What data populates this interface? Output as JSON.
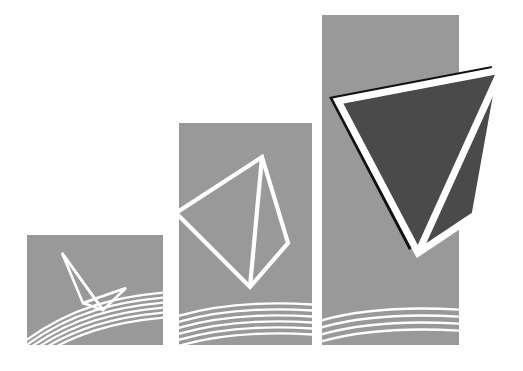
{
  "artwork": {
    "title": "Abstract bar-chart logo with tetrahedra",
    "canvas": {
      "width": 523,
      "height": 371,
      "background": "#ffffff"
    },
    "palette": {
      "bar_gray": "#999999",
      "solid_dark": "#4a4a4a",
      "shadow_black": "#111111",
      "outline_white": "#ffffff",
      "background": "#ffffff"
    },
    "bars": [
      {
        "name": "bar-small",
        "index": 1,
        "x": 27,
        "y": 235,
        "width": 136,
        "height": 110,
        "fill": "#999999",
        "wire_label": "small-tetrahedron",
        "wire_points": "62,253 83,303 126,288 103,310 62,253",
        "wire_edges": [
          "62,253 83,303",
          "83,303 126,288",
          "126,288 103,310",
          "103,310 62,253",
          "83,303 103,310"
        ],
        "arcs": [
          "27,338 C 70,305 120,296 163,292",
          "27,341 C 70,309 120,300 163,296",
          "27,344 C 70,313 120,304 163,300",
          "27,347 C 70,317 120,308 163,304",
          "27,350 C 70,321 120,312 163,308",
          "27,353 C 70,325 120,316 163,312"
        ]
      },
      {
        "name": "bar-medium",
        "index": 2,
        "x": 179,
        "y": 123,
        "width": 133,
        "height": 222,
        "fill": "#999999",
        "wire_label": "medium-tetrahedron",
        "wire_points": "262,157 180,215 250,285 286,242 262,157",
        "wire_edges": [
          "262,157 180,215",
          "180,215 250,285",
          "250,285 286,242",
          "286,242 262,157",
          "262,157 250,285"
        ],
        "arcs": [
          "179,318 C 222,305 268,302 312,305",
          "179,323 C 222,310 268,307 312,310",
          "179,328 C 222,315 268,312 312,315",
          "179,333 C 222,320 268,317 312,320",
          "179,338 C 222,325 268,322 312,325",
          "179,343 C 222,330 268,327 312,330"
        ]
      },
      {
        "name": "bar-large",
        "index": 3,
        "x": 322,
        "y": 15,
        "width": 137,
        "height": 330,
        "fill": "#999999",
        "wire_label": "large-solid-tetrahedron",
        "wire_points": "337,101 500,70 474,214 418,253 337,101",
        "arcs": [
          "322,320 C 358,308 408,304 459,308",
          "322,326 C 358,314 408,310 459,314",
          "322,332 C 358,320 408,316 459,320",
          "322,338 C 358,326 408,322 459,326"
        ]
      }
    ],
    "solid_shape": {
      "name": "featured-tetrahedron",
      "shadow_points": "329,96 492,65 466,209 410,248",
      "face_points": "337,101 500,70 474,214 418,253",
      "outline_points": "337,101 500,70 474,214 418,253",
      "inner_edge": "500,70 418,253",
      "fill": "#4a4a4a",
      "shadow_fill": "#111111",
      "outline": "#ffffff",
      "outline_width": 7
    }
  }
}
